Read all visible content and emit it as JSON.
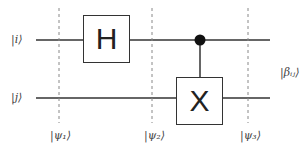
{
  "diagram": {
    "type": "quantum-circuit",
    "inputs": [
      {
        "label": "|i⟩"
      },
      {
        "label": "|j⟩"
      }
    ],
    "gates": [
      {
        "label": "H",
        "wire": 0
      },
      {
        "label": "X",
        "wire": 1,
        "control_wire": 0
      }
    ],
    "states": [
      {
        "label": "|ψ₁⟩"
      },
      {
        "label": "|ψ₂⟩"
      },
      {
        "label": "|ψ₃⟩"
      }
    ],
    "output": {
      "label": "|βᵢⱼ⟩"
    }
  }
}
